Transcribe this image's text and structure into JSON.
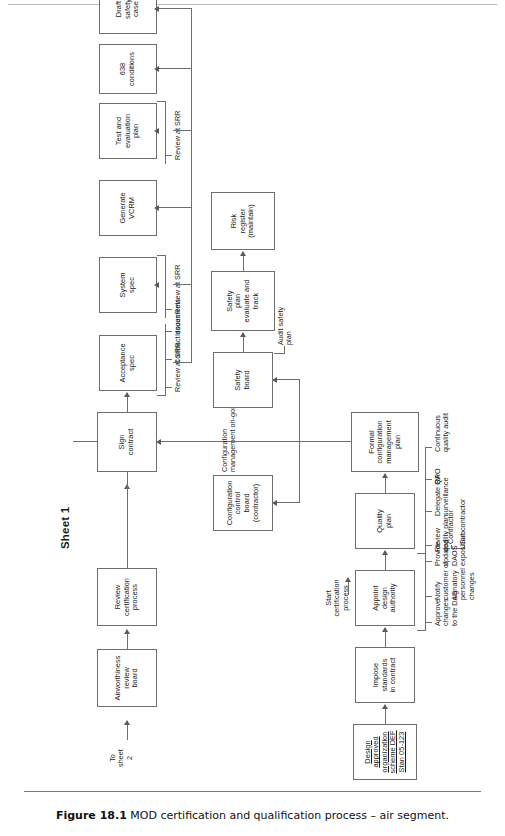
{
  "figure": {
    "sheet_label": "Sheet 1",
    "caption_number": "Figure 18.1",
    "caption_text": "MOD certification and qualification process – air segment."
  },
  "nodes": {
    "design_org": "Design\napproved\norganization\nscheme DEF\nStan 05-123",
    "impose_standards": "Impose\nstandards\nin contract",
    "appoint_das": "Appoint\ndesign\nauthority",
    "quality_plan": "Quality\nplan",
    "formal_cm_plan": "Formal\nconfiguration\nmanagement\nplan",
    "cc_board": "Configuration\ncontrol\nboard\n(contractor)",
    "safety_board": "Safety\nboard",
    "safety_plan": "Safety\nplan\nevaluate and\ntrack",
    "risk_register": "Risk\nregister\n(maintain)",
    "sign_contract": "Sign\ncontract",
    "review_cert_process": "Review\ncertification\nprocess",
    "airworthiness_board": "Airworthiness\nreview\nboard",
    "acceptance_spec": "Acceptance\nspec",
    "system_spec": "System\nspec",
    "generate_vcrm": "Generate\nVCRM",
    "test_eval_plan": "Test and\nevaluation\nplan",
    "conditions_638": "638\nconditions",
    "draft_safety_case": "Draft\nsafety\ncase"
  },
  "annotations": {
    "start_cert": "Start\ncertification\nprocess",
    "approve_changes": "Approve\nchanges\nto the DAS",
    "notify_customer": "Notify\ncustomer of\nsignatory\npersonnel\nchanges",
    "provide_daos": "Provide\nupdated\nDAOS\nexposition",
    "review_quality_plan": "Review\nquality plan",
    "contractor": "Contractor",
    "subcontractor": "Subcontractor",
    "delegate_qa": "Delegate QA\nsurveillance",
    "rpo": "RPO",
    "continuous_audit": "Continuous\nquality audit",
    "cm_ongoing": "Configuration\nmanagement on-going",
    "audit_safety_plan": "Audit safety\nplan",
    "review_srr_1": "Review at SRR",
    "contract_documents": "Contract documents",
    "issues": "Issues",
    "review_srr_2": "Review at SRR",
    "review_srr_3": "Review at SRR",
    "review_srr_4": "Review at SRR",
    "to_sheet_2": "To\nsheet\n2"
  },
  "colors": {
    "box_border": "#6e6e6e",
    "line": "#6e6e6e",
    "text": "#1a1a1a",
    "background": "#ffffff"
  }
}
